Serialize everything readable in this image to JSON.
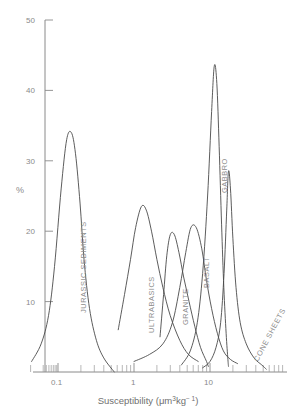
{
  "chart_data": {
    "type": "line",
    "title": "",
    "xlabel": "Susceptibility (μm³kg⁻¹)",
    "xlabel_parts": {
      "main": "Susceptibility (μm",
      "sup1": "3",
      "mid": "kg",
      "sup2": "− 1",
      "close": ")"
    },
    "ylabel": "%",
    "xscale": "log",
    "xlim": [
      0.04,
      60
    ],
    "ylim": [
      0,
      50
    ],
    "grid": false,
    "legend": "none (curves labelled inline)",
    "xticks": [
      {
        "value": 0.1,
        "label": "0.1"
      },
      {
        "value": 1,
        "label": "1"
      },
      {
        "value": 10,
        "label": "10"
      }
    ],
    "yticks": [
      {
        "value": 10,
        "label": "10"
      },
      {
        "value": 20,
        "label": "20"
      },
      {
        "value": 30,
        "label": "30"
      },
      {
        "value": 40,
        "label": "40"
      },
      {
        "value": 50,
        "label": "50"
      }
    ],
    "series": [
      {
        "name": "JURASSIC SEDIMENTS",
        "label": "JURASSIC SEDIMENTS",
        "peak_x": 0.14,
        "peak_y": 34,
        "x_range": [
          0.045,
          0.55
        ],
        "points_xy": [
          [
            0.045,
            1.5
          ],
          [
            0.06,
            4
          ],
          [
            0.075,
            8
          ],
          [
            0.09,
            15
          ],
          [
            0.11,
            26
          ],
          [
            0.13,
            33
          ],
          [
            0.15,
            34
          ],
          [
            0.17,
            31
          ],
          [
            0.195,
            24
          ],
          [
            0.22,
            16
          ],
          [
            0.26,
            9
          ],
          [
            0.32,
            4.5
          ],
          [
            0.4,
            2
          ],
          [
            0.55,
            0
          ]
        ]
      },
      {
        "name": "ULTRABASICS",
        "label": "ULTRABASICS",
        "peak_x": 1.3,
        "peak_y": 24,
        "x_range": [
          0.62,
          7.0
        ],
        "points_xy": [
          [
            0.62,
            6
          ],
          [
            0.75,
            11
          ],
          [
            0.9,
            16
          ],
          [
            1.05,
            20.5
          ],
          [
            1.25,
            23.5
          ],
          [
            1.45,
            23
          ],
          [
            1.7,
            20
          ],
          [
            2.0,
            16
          ],
          [
            2.4,
            12
          ],
          [
            3.0,
            8
          ],
          [
            4.0,
            4.5
          ],
          [
            5.2,
            2.5
          ],
          [
            7.0,
            1.5
          ]
        ]
      },
      {
        "name": "GRANITE",
        "label": "GRANITE",
        "peak_x": 3.0,
        "peak_y": 20,
        "x_range": [
          2.2,
          9.5
        ],
        "points_xy": [
          [
            2.2,
            5
          ],
          [
            2.45,
            11
          ],
          [
            2.7,
            16.5
          ],
          [
            3.0,
            19.5
          ],
          [
            3.4,
            19.5
          ],
          [
            3.9,
            17
          ],
          [
            4.5,
            13.5
          ],
          [
            5.3,
            10
          ],
          [
            6.3,
            6.5
          ],
          [
            7.5,
            3.5
          ],
          [
            9.0,
            1.5
          ],
          [
            9.5,
            0.8
          ]
        ]
      },
      {
        "name": "BASALT",
        "label": "BASALT",
        "peak_x": 5.8,
        "peak_y": 21,
        "x_range": [
          1.0,
          23.0
        ],
        "points_xy": [
          [
            1.0,
            1.5
          ],
          [
            1.6,
            2.5
          ],
          [
            2.4,
            4
          ],
          [
            3.2,
            7
          ],
          [
            4.0,
            12
          ],
          [
            4.8,
            17
          ],
          [
            5.6,
            20.5
          ],
          [
            6.6,
            20.5
          ],
          [
            7.8,
            17.5
          ],
          [
            9.0,
            13
          ],
          [
            10.5,
            9
          ],
          [
            12.5,
            5.5
          ],
          [
            15.0,
            3
          ],
          [
            18.5,
            1.8
          ],
          [
            23.0,
            1.2
          ]
        ]
      },
      {
        "name": "GABBRO",
        "label": "GABBRO",
        "peak_x": 11.5,
        "peak_y": 43.5,
        "x_range": [
          4.2,
          17.5
        ],
        "points_xy": [
          [
            4.2,
            1.0
          ],
          [
            5.5,
            3
          ],
          [
            6.8,
            7
          ],
          [
            8.0,
            14
          ],
          [
            9.3,
            25
          ],
          [
            10.5,
            37
          ],
          [
            11.4,
            43.5
          ],
          [
            12.3,
            41
          ],
          [
            13.2,
            32
          ],
          [
            14.2,
            21
          ],
          [
            15.2,
            12
          ],
          [
            16.3,
            5.5
          ],
          [
            17.2,
            1.8
          ],
          [
            17.5,
            0.8
          ]
        ]
      },
      {
        "name": "CONE SHEETS",
        "label": "CONE SHEETS",
        "peak_x": 17.5,
        "peak_y": 28.5,
        "x_range": [
          8.0,
          55.0
        ],
        "points_xy": [
          [
            8.0,
            0.6
          ],
          [
            10.0,
            1.5
          ],
          [
            12.0,
            3.5
          ],
          [
            13.8,
            7
          ],
          [
            15.3,
            14
          ],
          [
            16.6,
            23
          ],
          [
            17.5,
            28.5
          ],
          [
            18.6,
            26
          ],
          [
            20.0,
            19
          ],
          [
            22.0,
            12
          ],
          [
            25.0,
            7
          ],
          [
            30.0,
            4
          ],
          [
            38.0,
            2
          ],
          [
            48.0,
            1
          ],
          [
            55.0,
            0.4
          ]
        ]
      }
    ]
  }
}
